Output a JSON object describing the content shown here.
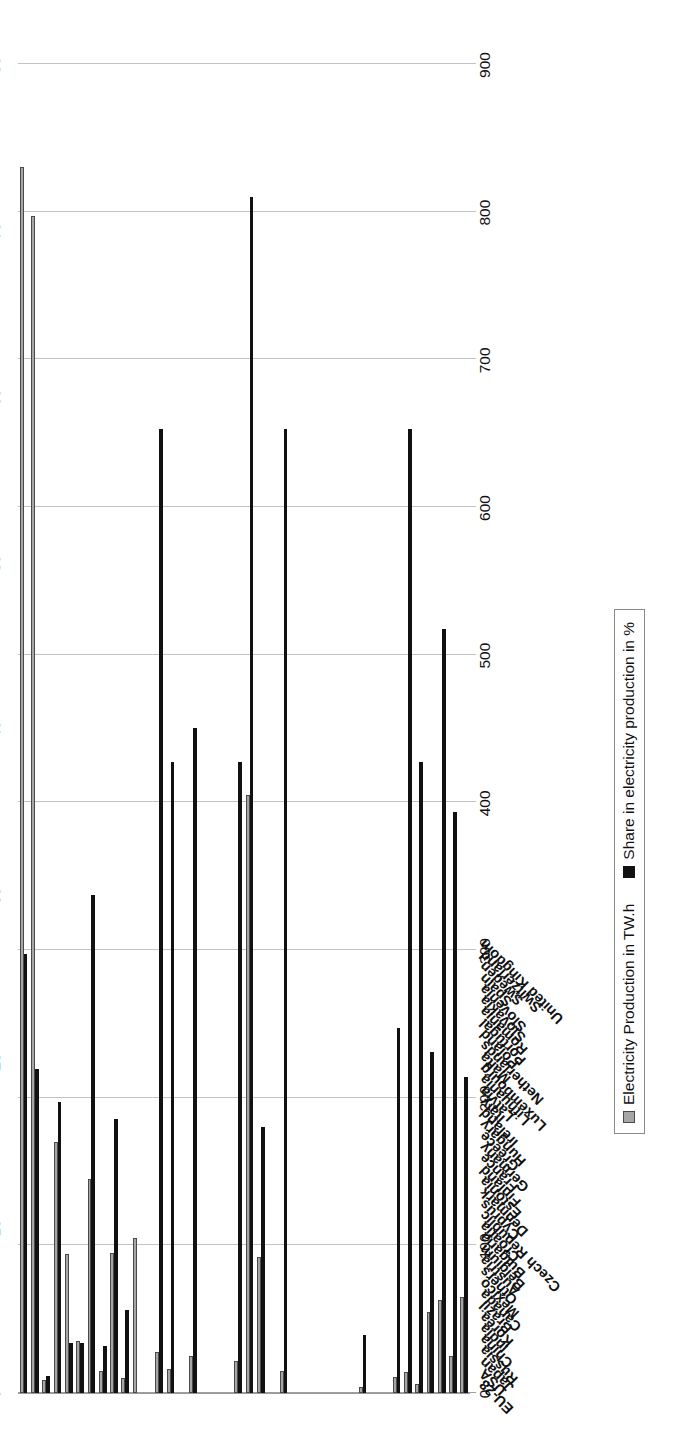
{
  "chart_data": {
    "type": "bar",
    "orientation": "vertical-rotated",
    "title": "",
    "xlabel": "",
    "grid": true,
    "legend_position": "bottom-center",
    "axes": {
      "primary": {
        "name": "Electricity Production in TW.h",
        "side": "bottom",
        "ticks": [
          0,
          100,
          200,
          300,
          400,
          500,
          600,
          700,
          800,
          900
        ],
        "range": [
          0,
          900
        ]
      },
      "secondary": {
        "name": "Share in electricity production in %",
        "side": "top",
        "ticks": [
          0,
          10,
          20,
          30,
          40,
          50,
          60,
          70,
          80
        ],
        "range": [
          0,
          80
        ]
      }
    },
    "categories": [
      "EU-28",
      "USA",
      "Japan",
      "Russia",
      "China",
      "India",
      "Korea",
      "Brazil",
      "Canada",
      "Mexico",
      "Others",
      "Austria",
      "Belgium",
      "Bulgaria",
      "Croatia",
      "Czech Republic",
      "Cyprus",
      "Denmark",
      "Estonia",
      "Finland",
      "France",
      "Germany",
      "Greece",
      "Hungary",
      "Ireland",
      "Italy",
      "Latvia",
      "Lithuania",
      "Luxembourg",
      "Malta",
      "Netherlands",
      "Poland",
      "Portugal",
      "Romania",
      "Slovakia",
      "Slovenia",
      "Spain",
      "Sweden",
      "Switzerland",
      "United Kingdom"
    ],
    "series": [
      {
        "name": "Electricity Production in TW.h",
        "color": "#a6a6a6",
        "axis": "primary",
        "values": [
          830,
          797,
          9,
          170,
          94,
          35,
          145,
          15,
          95,
          10,
          105,
          0,
          28,
          16,
          0,
          25,
          0,
          0,
          0,
          22,
          405,
          92,
          0,
          15,
          0,
          0,
          0,
          0,
          0,
          0,
          4,
          0,
          0,
          11,
          14,
          6,
          55,
          63,
          25,
          65
        ]
      },
      {
        "name": "Share in electricity production in %",
        "color": "#111111",
        "axis": "secondary",
        "values": [
          26.4,
          19.5,
          1.0,
          17.5,
          3.0,
          3.0,
          30.0,
          2.8,
          16.5,
          5.0,
          0,
          0,
          58.0,
          38.0,
          0,
          40.0,
          0,
          0,
          0,
          38.0,
          72.0,
          16.0,
          0,
          58.0,
          0,
          0,
          0,
          0,
          0,
          0,
          3.5,
          0,
          0,
          22.0,
          58.0,
          38.0,
          20.5,
          46.0,
          35.0,
          19.0
        ]
      }
    ]
  },
  "legend": {
    "entries": [
      {
        "label": "Electricity Production in TW.h",
        "color": "#a6a6a6"
      },
      {
        "label": "Share in electricity production in %",
        "color": "#111111"
      }
    ]
  }
}
